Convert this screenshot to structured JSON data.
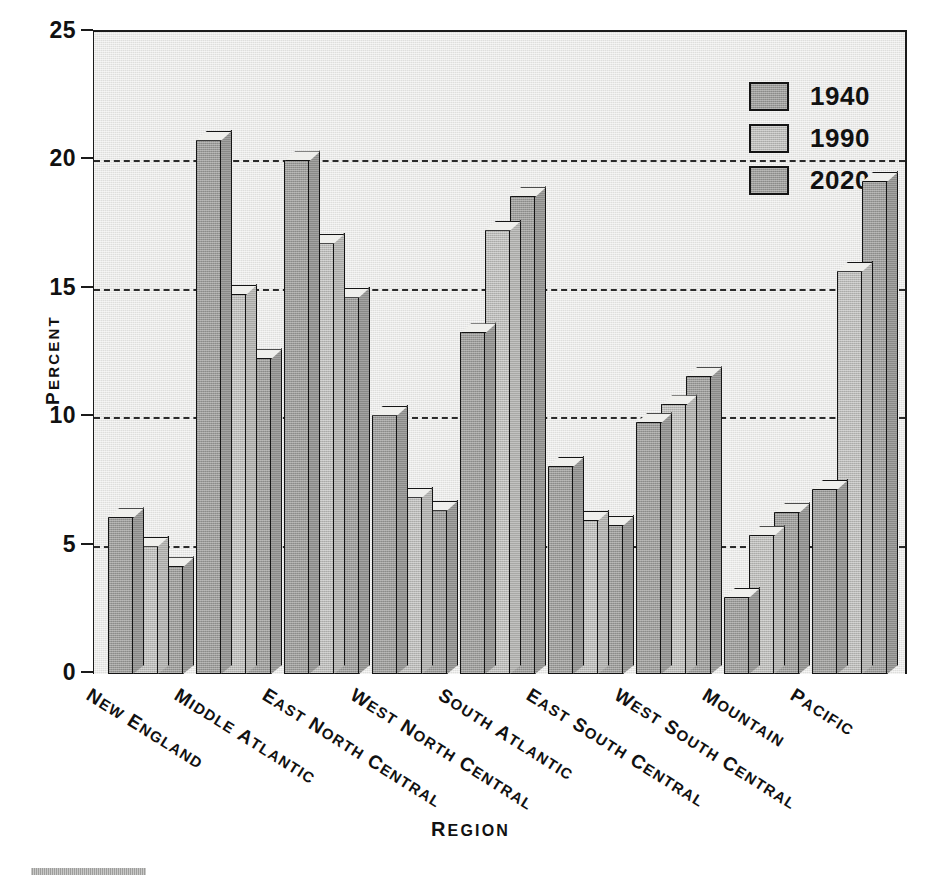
{
  "chart_data": {
    "type": "bar",
    "title": "",
    "xlabel": "REGION",
    "ylabel": "PERCENT",
    "ylim": [
      0,
      25
    ],
    "yticks": [
      0,
      5,
      10,
      15,
      20,
      25
    ],
    "grid": "horizontal dashed at 5, 10, 15, 20",
    "legend_position": "top-right inside plot",
    "categories": [
      "NEW ENGLAND",
      "MIDDLE ATLANTIC",
      "EAST NORTH CENTRAL",
      "WEST NORTH CENTRAL",
      "SOUTH ATLANTIC",
      "EAST SOUTH CENTRAL",
      "WEST SOUTH CENTRAL",
      "MOUNTAIN",
      "PACIFIC"
    ],
    "series": [
      {
        "name": "1940",
        "color": "#9b9b99",
        "values": [
          6.1,
          20.8,
          20.0,
          10.1,
          13.3,
          8.1,
          9.8,
          3.0,
          7.2
        ]
      },
      {
        "name": "1990",
        "color": "#b9b9b6",
        "values": [
          5.0,
          14.8,
          16.8,
          6.9,
          17.3,
          6.0,
          10.5,
          5.4,
          15.7
        ]
      },
      {
        "name": "2020",
        "color": "#9b9b99",
        "values": [
          4.2,
          12.3,
          14.7,
          6.4,
          18.6,
          5.8,
          11.6,
          6.3,
          19.2
        ]
      }
    ]
  },
  "axis": {
    "y_title": "PERCENT",
    "x_title": "REGION",
    "y_tick_labels": [
      "25",
      "20",
      "15",
      "10",
      "5",
      "0"
    ]
  },
  "legend": {
    "items": [
      {
        "label": "1940"
      },
      {
        "label": "1990"
      },
      {
        "label": "2020"
      }
    ]
  },
  "icons": {
    "legend_swatch": "square-swatch-icon",
    "footer_rule": "horizontal-rule-icon"
  }
}
